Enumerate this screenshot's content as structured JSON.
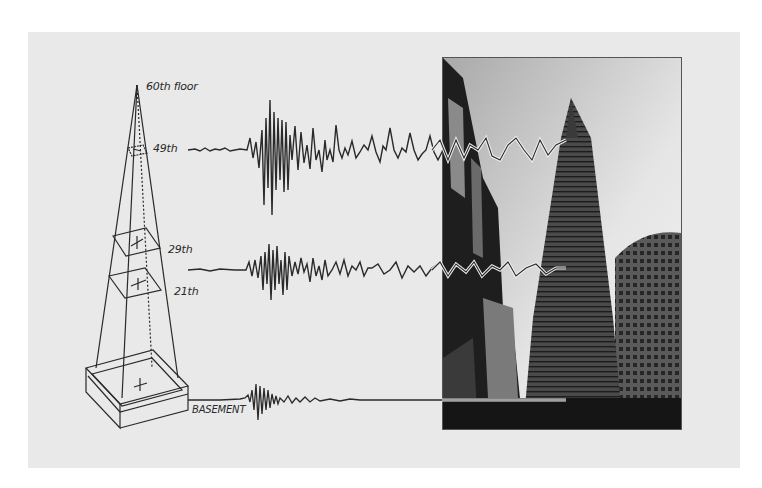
{
  "figure": {
    "colors": {
      "background": "#ffffff",
      "panel": "#e9e9e9",
      "line": "#2a2a2a",
      "trace_overlay": "#d8d8d8"
    },
    "diagram_labels": {
      "top": "60th floor",
      "floor_49": "49th",
      "floor_29": "29th",
      "floor_21": "21th",
      "basement": "BASEMENT"
    },
    "traces": [
      {
        "level": "49th",
        "amplitude": "large",
        "character": "long-period sway after shaking"
      },
      {
        "level": "29th",
        "amplitude": "medium",
        "character": "moderate shaking then sway"
      },
      {
        "level": "BASEMENT",
        "amplitude": "small",
        "character": "short burst, then flat"
      }
    ],
    "photo": {
      "subject": "pyramid skyscraper among city buildings",
      "style": "black-and-white"
    }
  }
}
